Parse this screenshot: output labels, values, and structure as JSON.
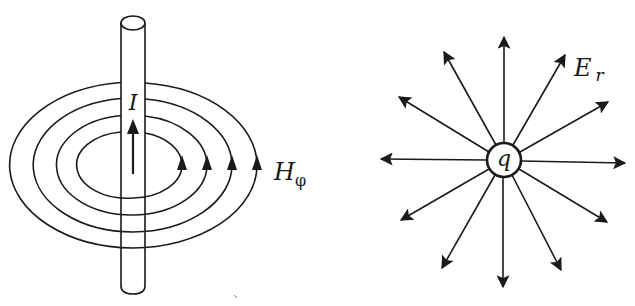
{
  "figure": {
    "left": {
      "title": "Magnetic field around a current-carrying wire",
      "current_label": "I",
      "field_label_main": "H",
      "field_label_sub": "φ",
      "ring_count": 4,
      "rings": [
        {
          "rx": 50,
          "ry": 33
        },
        {
          "rx": 75,
          "ry": 50
        },
        {
          "rx": 100,
          "ry": 67
        },
        {
          "rx": 125,
          "ry": 83
        }
      ],
      "ring_direction": "counterclockwise (arrows pointing up on right side)",
      "current_direction": "up"
    },
    "right": {
      "title": "Radial electric field of a point charge",
      "charge_label": "q",
      "field_label_main": "E",
      "field_label_sub": "r",
      "arrow_count": 14,
      "arrow_direction": "outward"
    },
    "colors": {
      "ink": "#1a1a1a",
      "background": "#ffffff"
    }
  }
}
